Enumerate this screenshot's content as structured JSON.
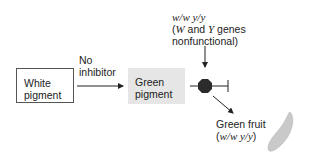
{
  "diagram": {
    "nodes": {
      "white_pigment": {
        "line1": "White",
        "line2": "pigment"
      },
      "green_pigment": {
        "line1": "Green",
        "line2": "pigment"
      }
    },
    "edge_label": {
      "line1": "No",
      "line2": "inhibitor"
    },
    "genotype_note": {
      "genotype": "w/w y/y",
      "desc_open": "(",
      "gene_w": "W",
      "desc_and": " and ",
      "gene_y": "Y",
      "desc_rest": " genes",
      "line3": "nonfunctional)"
    },
    "outcome": {
      "line1": "Green fruit",
      "line2_open": "(",
      "line2_genotype": "w/w y/y",
      "line2_close": ")"
    },
    "icons": [
      "blocked-enzyme-octagon-icon",
      "inhibition-bar-icon",
      "fruit-icon"
    ],
    "colors": {
      "green_box_fill": "#e6e6e6",
      "octagon": "#2b2b2b",
      "fruit": "#c8c8c8"
    }
  }
}
